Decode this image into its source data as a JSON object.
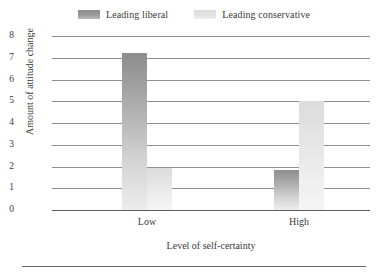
{
  "chart_data": {
    "type": "bar",
    "title": "",
    "subtitle": "",
    "xlabel": "Level of self-certainty",
    "ylabel": "Amount of attitude change",
    "categories": [
      "Low",
      "High"
    ],
    "series": [
      {
        "name": "Leading liberal",
        "values": [
          7.2,
          1.85
        ],
        "color": "#9a9a9a"
      },
      {
        "name": "Leading conservative",
        "values": [
          1.95,
          5.0
        ],
        "color": "#e3e3e3"
      }
    ],
    "ylim": [
      0,
      8
    ],
    "yticks": [
      "8",
      "7",
      "6",
      "5",
      "4",
      "3",
      "2",
      "1",
      "0"
    ],
    "ytick_values": [
      8,
      7,
      6,
      5,
      4,
      3,
      2,
      1,
      0
    ],
    "grid": true,
    "grid_axis": "y",
    "legend_position": "top-center"
  },
  "legend": {
    "entries": [
      {
        "label": "Leading liberal",
        "swatch": "legend-swatch-liberal"
      },
      {
        "label": "Leading conservative",
        "swatch": "legend-swatch-conservative"
      }
    ]
  },
  "axes": {
    "y_title": "Amount of attitude change",
    "x_title": "Level of self-certainty",
    "y_ticks": [
      "8",
      "7",
      "6",
      "5",
      "4",
      "3",
      "2",
      "1",
      "0"
    ],
    "x_ticks": [
      "Low",
      "High"
    ]
  },
  "colors": {
    "liberal_top": "#8d8d8d",
    "liberal_bottom": "#ececec",
    "conservative_top": "#dcdcdc",
    "conservative_bottom": "#f5f5f5",
    "gridline": "#8e8e8e",
    "baseline": "#5f5f5f",
    "text": "#3a3a3a",
    "background": "#ffffff"
  }
}
